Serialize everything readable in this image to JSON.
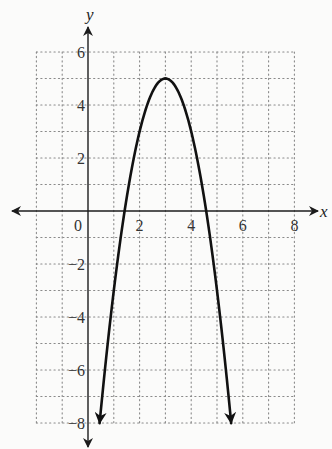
{
  "chart_data": {
    "type": "line",
    "title": "",
    "xlabel": "x",
    "ylabel": "y",
    "function": "y = -2(x - 3)^2 + 5",
    "xlim": [
      -2,
      8
    ],
    "ylim": [
      -8,
      6
    ],
    "grid": true,
    "grid_style": "dotted",
    "grid_step": 1,
    "x_ticks": [
      0,
      2,
      4,
      6,
      8
    ],
    "x_tick_labels": [
      "0",
      "2",
      "4",
      "6",
      "8"
    ],
    "y_ticks": [
      6,
      4,
      2,
      -2,
      -4,
      -6,
      -8
    ],
    "y_tick_labels": [
      "6",
      "4",
      "2",
      "−2",
      "−4",
      "−6",
      "−8"
    ],
    "series": [
      {
        "name": "parabola",
        "vertex": [
          3,
          5
        ],
        "x_intercepts": [
          1.42,
          4.58
        ],
        "x": [
          0.45,
          1,
          1.5,
          2,
          2.5,
          3,
          3.5,
          4,
          4.5,
          5,
          5.55
        ],
        "y": [
          -8,
          -3,
          0.5,
          3,
          4.5,
          5,
          4.5,
          3,
          0.5,
          -3,
          -8
        ],
        "end_arrows": true,
        "color": "#111111"
      }
    ],
    "legend": null
  },
  "colors": {
    "background": "#fbfbfa",
    "axis": "#1c1c1c",
    "grid": "#8a8a8a",
    "curve": "#111111"
  }
}
